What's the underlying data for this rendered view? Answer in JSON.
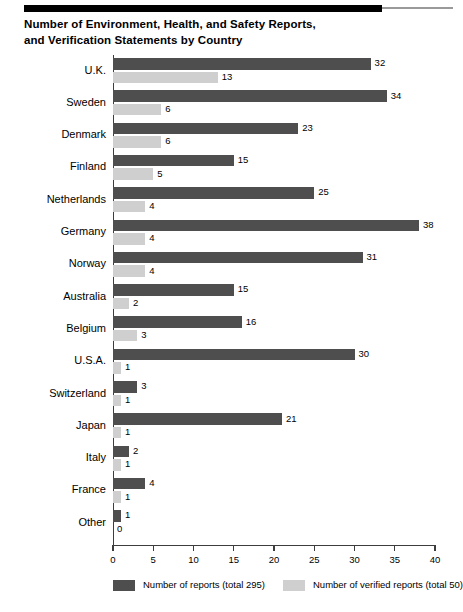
{
  "title": {
    "line1": "Number of Environment, Health, and Safety Reports,",
    "line2": "and Verification Statements by Country"
  },
  "chart_data": {
    "type": "bar",
    "orientation": "horizontal",
    "title": "Number of Environment, Health, and Safety Reports, and Verification Statements by Country",
    "xlabel": "",
    "ylabel": "",
    "xlim": [
      0,
      40
    ],
    "xticks": [
      0,
      5,
      10,
      15,
      20,
      25,
      30,
      35,
      40
    ],
    "grid": false,
    "legend_position": "bottom",
    "categories": [
      "U.K.",
      "Sweden",
      "Denmark",
      "Finland",
      "Netherlands",
      "Germany",
      "Norway",
      "Australia",
      "Belgium",
      "U.S.A.",
      "Switzerland",
      "Japan",
      "Italy",
      "France",
      "Other"
    ],
    "series": [
      {
        "name": "Number of reports (total 295)",
        "color": "#4e4e4e",
        "values": [
          32,
          34,
          23,
          15,
          25,
          38,
          31,
          15,
          16,
          30,
          3,
          21,
          2,
          4,
          1
        ]
      },
      {
        "name": "Number of verified reports (total 50)",
        "color": "#cfcfcf",
        "values": [
          13,
          6,
          6,
          5,
          4,
          4,
          4,
          2,
          3,
          1,
          1,
          1,
          1,
          1,
          0
        ]
      }
    ]
  },
  "legend": [
    {
      "label": "Number of reports (total 295)",
      "swatch": "dark"
    },
    {
      "label": "Number of verified reports (total 50)",
      "swatch": "light"
    }
  ]
}
